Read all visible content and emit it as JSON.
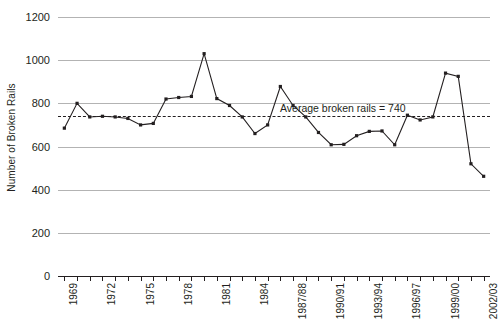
{
  "chart_data": {
    "type": "line",
    "title": "",
    "xlabel": "",
    "ylabel": "Number of Broken Rails",
    "ylim": [
      0,
      1200
    ],
    "yticks": [
      0,
      200,
      400,
      600,
      800,
      1000,
      1200
    ],
    "grid": true,
    "legend": "none",
    "categories": [
      "1969",
      "1970",
      "1971",
      "1972",
      "1973",
      "1974",
      "1975",
      "1976",
      "1977",
      "1978",
      "1979",
      "1980",
      "1981",
      "1982",
      "1983",
      "1984",
      "1985/86",
      "1986/87",
      "1987/88",
      "1988/89",
      "1989/90",
      "1990/91",
      "1991/92",
      "1992/93",
      "1993/94",
      "1994/95",
      "1995/96",
      "1996/97",
      "1997/98",
      "1998/99",
      "1999/00",
      "2000/01",
      "2001/02",
      "2002/03"
    ],
    "values": [
      685,
      800,
      737,
      740,
      737,
      730,
      700,
      707,
      820,
      827,
      832,
      1030,
      822,
      790,
      737,
      660,
      700,
      878,
      790,
      737,
      665,
      608,
      610,
      650,
      670,
      672,
      608,
      745,
      723,
      737,
      940,
      925,
      520,
      462
    ],
    "annotations": [
      {
        "name": "average-line",
        "label": "Average broken rails = 740",
        "value": 740
      }
    ],
    "xtick_labels": [
      {
        "index": 0,
        "label": "1969"
      },
      {
        "index": 3,
        "label": "1972"
      },
      {
        "index": 6,
        "label": "1975"
      },
      {
        "index": 9,
        "label": "1978"
      },
      {
        "index": 12,
        "label": "1981"
      },
      {
        "index": 15,
        "label": "1984"
      },
      {
        "index": 18,
        "label": "1987/88"
      },
      {
        "index": 21,
        "label": "1990/91"
      },
      {
        "index": 24,
        "label": "1993/94"
      },
      {
        "index": 27,
        "label": "1996/97"
      },
      {
        "index": 30,
        "label": "1999/00"
      },
      {
        "index": 33,
        "label": "2002/03"
      }
    ],
    "colors": {
      "series": "#231f20",
      "gridline": "#b3b3b3",
      "axis": "#231f20",
      "background": "#ffffff"
    }
  }
}
